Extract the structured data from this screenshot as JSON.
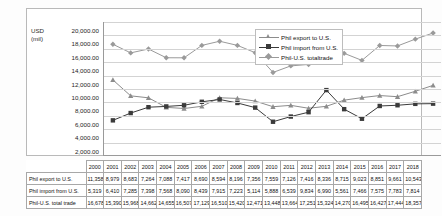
{
  "chart_data": {
    "type": "line",
    "title": "",
    "xlabel": "",
    "ylabel": "USD (mil)",
    "ylim": [
      0,
      20000
    ],
    "ytick_step": 2000,
    "grid": true,
    "legend_position": "upper-center-right",
    "categories": [
      "2000",
      "2001",
      "2002",
      "2003",
      "2004",
      "2005",
      "2006",
      "2007",
      "2008",
      "2009",
      "2010",
      "2011",
      "2012",
      "2013",
      "2014",
      "2015",
      "2016",
      "2017",
      "2018"
    ],
    "series": [
      {
        "name": "Phil export to U.S.",
        "color": "#8c8c8c",
        "marker": "triangle",
        "values": [
          11358,
          8979,
          8683,
          7264,
          7088,
          7417,
          8690,
          8594,
          8196,
          7356,
          7559,
          7126,
          7416,
          8336,
          8715,
          9023,
          8851,
          9661,
          10543
        ]
      },
      {
        "name": "Phil import from U.S.",
        "color": "#3b3b3b",
        "marker": "square",
        "values": [
          5319,
          6410,
          7285,
          7398,
          7568,
          8090,
          8439,
          7915,
          7223,
          5114,
          5888,
          6539,
          9834,
          6990,
          5561,
          7466,
          7575,
          7783,
          7814
        ]
      },
      {
        "name": "Phil-U.S. totaltrade",
        "color": "#9a9a9a",
        "marker": "diamond",
        "values": [
          16678,
          15390,
          15968,
          14662,
          14655,
          16507,
          17129,
          16510,
          15420,
          12471,
          13448,
          13664,
          17251,
          15324,
          14270,
          16495,
          16427,
          17444,
          18357
        ]
      }
    ],
    "ytick_labels": [
      "0.00",
      "2,000.00",
      "4,000.00",
      "6,000.00",
      "8,000.00",
      "10,000.00",
      "12,000.00",
      "14,000.00",
      "16,000.00",
      "18,000.00",
      "20,000.00"
    ],
    "ytick_values": [
      0,
      2000,
      4000,
      6000,
      8000,
      10000,
      12000,
      14000,
      16000,
      18000,
      20000
    ]
  },
  "axis": {
    "unit_line1": "USD",
    "unit_line2": "(mil)"
  },
  "legend": {
    "items": [
      {
        "label": "Phil export to U.S.",
        "color": "#8c8c8c",
        "marker": "triangle"
      },
      {
        "label": "Phil import from U.S.",
        "color": "#3b3b3b",
        "marker": "square"
      },
      {
        "label": "Phil-U.S. totaltrade",
        "color": "#9a9a9a",
        "marker": "diamond"
      }
    ]
  },
  "table": {
    "corner": "",
    "columns": [
      "2000",
      "2001",
      "2002",
      "2003",
      "2004",
      "2005",
      "2006",
      "2007",
      "2008",
      "2009",
      "2010",
      "2011",
      "2012",
      "2013",
      "2014",
      "2015",
      "2016",
      "2017",
      "2018"
    ],
    "rows": [
      {
        "header": "Phil export to U.S.",
        "cells": [
          "11,358",
          "8,979",
          "8,683",
          "7,264",
          "7,088",
          "7,417",
          "8,690",
          "8,594",
          "8,196",
          "7,356",
          "7,559",
          "7,126",
          "7,416",
          "8,336",
          "8,715",
          "9,023",
          "8,851",
          "9,661",
          "10,543"
        ]
      },
      {
        "header": "Phil import from U.S.",
        "cells": [
          "5,319",
          "6,410",
          "7,285",
          "7,398",
          "7,568",
          "8,090",
          "8,439",
          "7,915",
          "7,223",
          "5,114",
          "5,888",
          "6,539",
          "9,834",
          "6,990",
          "5,561",
          "7,466",
          "7,575",
          "7,783",
          "7,814"
        ]
      },
      {
        "header": "Phil-U.S. total trade",
        "cells": [
          "16,678",
          "15,390",
          "15,968",
          "14,662",
          "14,655",
          "16,507",
          "17,129",
          "16,510",
          "15,420",
          "12,471",
          "13,448",
          "13,664",
          "17,251",
          "15,324",
          "14,270",
          "16,495",
          "16,427",
          "17,444",
          "18,357"
        ]
      }
    ]
  }
}
